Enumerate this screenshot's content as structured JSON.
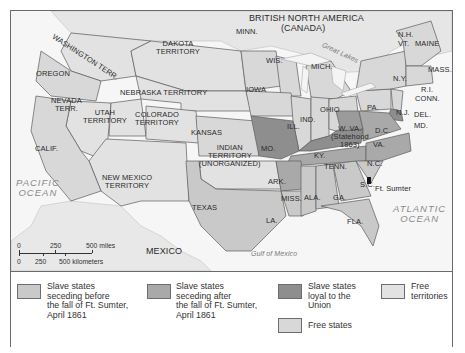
{
  "map": {
    "title_region": "BRITISH NORTH AMERICA",
    "title_region_sub": "(CANADA)",
    "water": {
      "great_lakes": "Great Lakes",
      "pacific": [
        "PACIFIC",
        "OCEAN"
      ],
      "atlantic": [
        "ATLANTIC",
        "OCEAN"
      ],
      "gulf": "Gulf of Mexico"
    },
    "countries": {
      "mexico": "MEXICO"
    },
    "territories": {
      "washington": "WASHINGTON TERR.",
      "dakota": [
        "DAKOTA",
        "TERRITORY"
      ],
      "nebraska": "NEBRASKA TERRITORY",
      "nevada": [
        "NEVADA",
        "TERR."
      ],
      "utah": [
        "UTAH",
        "TERRITORY"
      ],
      "colorado": [
        "COLORADO",
        "TERRITORY"
      ],
      "new_mexico": [
        "NEW MEXICO",
        "TERRITORY"
      ],
      "indian": [
        "INDIAN",
        "TERRITORY",
        "(UNORGANIZED)"
      ]
    },
    "states": {
      "oregon": "OREGON",
      "calif": "CALIF.",
      "minn": "MINN.",
      "wis": "WIS.",
      "mich": "MICH.",
      "iowa": "IOWA",
      "ill": "ILL.",
      "ind": "IND.",
      "ohio": "OHIO",
      "kansas": "KANSAS",
      "mo": "MO.",
      "ky": "KY.",
      "wva": [
        "W. VA.",
        "(Statehood",
        "1863)"
      ],
      "dc": "D.C.",
      "va": "VA.",
      "pa": "PA.",
      "ny": "N.Y.",
      "nj": "N.J.",
      "del": "DEL.",
      "md": "MD.",
      "nh": "N.H.",
      "vt": "VT.",
      "maine": "MAINE",
      "mass": "MASS.",
      "ri": "R.I.",
      "conn": "CONN.",
      "tenn": "TENN.",
      "nc": "N.C.",
      "sc": "S.C.",
      "ark": "ARK.",
      "texas": "TEXAS",
      "la": "LA.",
      "miss": "MISS.",
      "ala": "ALA.",
      "ga": "GA.",
      "fla": "FLA."
    },
    "markers": {
      "ft_sumter": "Ft. Sumter"
    },
    "scale": {
      "miles_ticks": [
        "0",
        "250",
        "500 miles"
      ],
      "km_ticks": [
        "0",
        "250",
        "500 kilometers"
      ]
    }
  },
  "legend": {
    "items": [
      {
        "label": [
          "Slave states",
          "seceding before",
          "the fall of Ft. Sumter,",
          "April 1861"
        ],
        "color": "#c9c9c9"
      },
      {
        "label": [
          "Slave states",
          "seceding after",
          "the fall of Ft. Sumter,",
          "April 1861"
        ],
        "color": "#a9a9a9"
      },
      {
        "label": [
          "Slave states",
          "loyal to the",
          "Union"
        ],
        "color": "#8e8e8e"
      },
      {
        "label": [
          "Free states"
        ],
        "color": "#d8d8d8"
      },
      {
        "label": [
          "Free",
          "territories"
        ],
        "color": "#e2e2e2"
      }
    ]
  },
  "colors": {
    "seceded_before": "#c9c9c9",
    "seceded_after": "#a9a9a9",
    "loyal_slave": "#8e8e8e",
    "free_state": "#d8d8d8",
    "free_territory": "#e2e2e2",
    "water": "#f6f6f6",
    "foreign": "#ececec",
    "border": "#5c5c5c"
  }
}
